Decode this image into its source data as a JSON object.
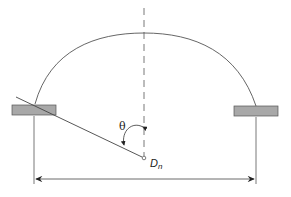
{
  "diagram": {
    "labels": {
      "angle": "θ",
      "nozzle_main": "D",
      "nozzle_sub": "n"
    },
    "colors": {
      "line": "#555555",
      "flange_fill": "#a8a8a8",
      "flange_stroke": "#555555",
      "background": "#ffffff"
    }
  }
}
